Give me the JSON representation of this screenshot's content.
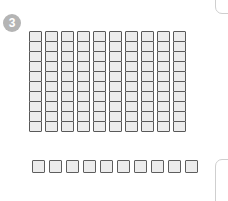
{
  "step": {
    "badge_label": "3",
    "badge_color": "#b4b4b4",
    "badge_text_color": "#ffffff"
  },
  "workspace": {
    "name": "base-ten-blocks-workspace",
    "background": "#ffffff"
  },
  "blocks": {
    "unit_fill": "#ececec",
    "unit_border": "#595959",
    "hundred_flat": {
      "label": "hundred-flat",
      "columns": 10,
      "rows": 10,
      "total_units": 100
    },
    "ten_strip": {
      "label": "ten-rod",
      "count": 10,
      "total_units": 10
    },
    "grand_total": 110
  },
  "panels": {
    "top_right": {
      "label": "panel-edge-top-right",
      "border_color": "#cfcfcf"
    },
    "bottom_right": {
      "label": "panel-edge-bottom-right",
      "border_color": "#cfcfcf"
    }
  }
}
